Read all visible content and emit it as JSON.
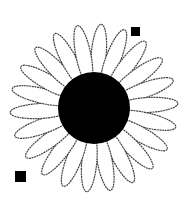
{
  "image": {
    "subject": "daisy flower line drawing",
    "background_color": "#ffffff",
    "center_color": "#000000",
    "petal_fill": "#ffffff",
    "petal_stroke": "#444444"
  },
  "flower": {
    "center": {
      "cx": 94,
      "cy": 108,
      "r": 36
    },
    "petal_count": 22,
    "petal_length": 48,
    "petal_width": 15
  },
  "markers": [
    {
      "name": "top-right-marker",
      "x": 131,
      "y": 27,
      "size": 9
    },
    {
      "name": "bottom-left-marker",
      "x": 15,
      "y": 171,
      "size": 11
    }
  ]
}
